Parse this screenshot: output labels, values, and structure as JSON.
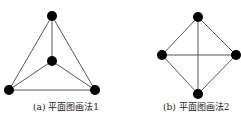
{
  "figures": [
    {
      "id": "a",
      "caption": "(a) 平面图画法1",
      "nodes": [
        {
          "id": "top",
          "x": 52,
          "y": 16
        },
        {
          "id": "center",
          "x": 52,
          "y": 61
        },
        {
          "id": "bottom-left",
          "x": 9,
          "y": 90
        },
        {
          "id": "bottom-right",
          "x": 95,
          "y": 90
        }
      ],
      "edges": [
        [
          "top",
          "center"
        ],
        [
          "top",
          "bottom-left"
        ],
        [
          "top",
          "bottom-right"
        ],
        [
          "center",
          "bottom-left"
        ],
        [
          "center",
          "bottom-right"
        ],
        [
          "bottom-left",
          "bottom-right"
        ]
      ]
    },
    {
      "id": "b",
      "caption": "(b) 平面图画法2",
      "nodes": [
        {
          "id": "top",
          "x": 198,
          "y": 17
        },
        {
          "id": "left",
          "x": 162,
          "y": 55
        },
        {
          "id": "right",
          "x": 236,
          "y": 55
        },
        {
          "id": "bottom",
          "x": 198,
          "y": 94
        }
      ],
      "edges": [
        [
          "top",
          "left"
        ],
        [
          "top",
          "right"
        ],
        [
          "top",
          "bottom"
        ],
        [
          "left",
          "right"
        ],
        [
          "left",
          "bottom"
        ],
        [
          "right",
          "bottom"
        ]
      ]
    }
  ],
  "style": {
    "node_color": "#000000",
    "edge_color": "#444444",
    "node_radius": 5
  }
}
